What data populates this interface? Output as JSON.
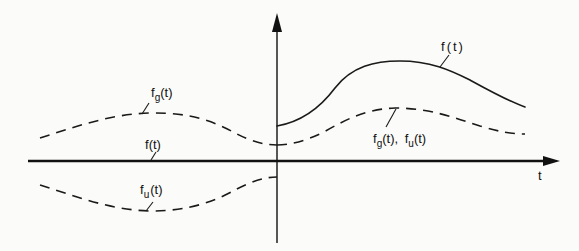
{
  "diagram": {
    "axes": {
      "horizontal_label": "t",
      "vertical_label": ""
    },
    "labels": {
      "f_right": {
        "base": "f",
        "sub": "",
        "tail": "(t)"
      },
      "fg_left": {
        "base": "f",
        "sub": "g",
        "tail": "(t)"
      },
      "f_left": {
        "base": "f",
        "sub": "",
        "tail": "(t)"
      },
      "fu_left": {
        "base": "f",
        "sub": "u",
        "tail": "(t)"
      },
      "fgfu_right": {
        "base1": "f",
        "sub1": "g",
        "mid": "(t), ",
        "base2": "f",
        "sub2": "u",
        "tail": "(t)"
      }
    },
    "curves": [
      {
        "name": "f(t)",
        "style": "solid",
        "region": "t>0",
        "note": "signal, zero for t<0"
      },
      {
        "name": "f(t)",
        "style": "solid",
        "region": "t<0",
        "note": "coincides with the t-axis"
      },
      {
        "name": "f_g(t)",
        "style": "dashed",
        "region": "t<0",
        "note": "even part, mirror of right dashed curve"
      },
      {
        "name": "f_g(t), f_u(t)",
        "style": "dashed",
        "region": "t>0",
        "note": "even and odd parts coincide for t>0 (half of f)"
      },
      {
        "name": "f_u(t)",
        "style": "dashed",
        "region": "t<0",
        "note": "odd part, negative mirror"
      }
    ]
  }
}
